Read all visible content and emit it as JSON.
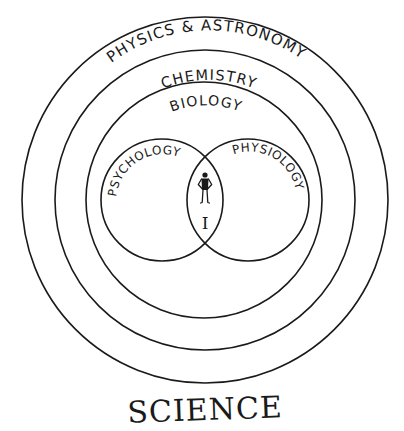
{
  "diagram": {
    "title": "SCIENCE",
    "rings": [
      {
        "id": "physics-astronomy",
        "label": "PHYSICS & ASTRONOMY"
      },
      {
        "id": "chemistry",
        "label": "CHEMISTRY"
      },
      {
        "id": "biology",
        "label": "BIOLOGY"
      }
    ],
    "venn": [
      {
        "id": "psychology",
        "label": "PSYCHOLOGY"
      },
      {
        "id": "physiology",
        "label": "PHYSIOLOGY"
      }
    ],
    "intersection": {
      "icon": "person-figure-icon",
      "label": "I"
    },
    "colors": {
      "ink": "#1a1a1a",
      "background": "#ffffff"
    }
  }
}
